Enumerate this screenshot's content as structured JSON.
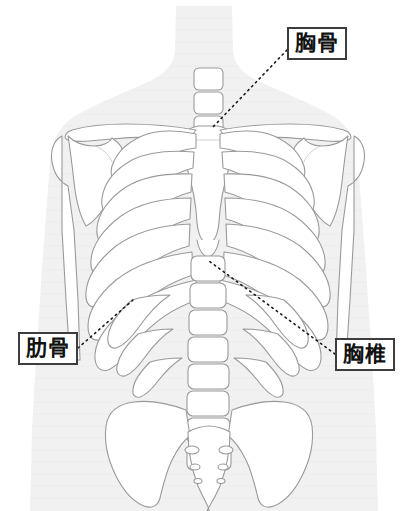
{
  "diagram": {
    "type": "anatomy-illustration",
    "region": "thorax",
    "view": "anterior",
    "colors": {
      "body_silhouette": "#f1f1f1",
      "bone_fill": "#ffffff",
      "bone_outline": "#9a9a9a",
      "label_border": "#3d3d3d",
      "label_text": "#111111",
      "leader_line": "#1a1a1a",
      "background": "#ffffff"
    }
  },
  "labels": [
    {
      "id": "sternum",
      "text": "胸骨",
      "reading": "kyokotsu",
      "english": "sternum",
      "box": {
        "x": 287,
        "y": 27,
        "width": 60,
        "height": 33
      },
      "leader": {
        "from_x": 287,
        "from_y": 50,
        "to_x": 212,
        "to_y": 128
      }
    },
    {
      "id": "ribs",
      "text": "肋骨",
      "reading": "rokkotsu",
      "english": "ribs",
      "box": {
        "x": 18,
        "y": 332,
        "width": 60,
        "height": 33
      },
      "leader": {
        "from_x": 78,
        "from_y": 348,
        "to_x": 133,
        "to_y": 300
      }
    },
    {
      "id": "thoracic-vertebrae",
      "text": "胸椎",
      "reading": "kyoutsui",
      "english": "thoracic vertebrae",
      "box": {
        "x": 335,
        "y": 338,
        "width": 60,
        "height": 33
      },
      "leader": {
        "from_x": 335,
        "from_y": 354,
        "to_x": 209,
        "to_y": 261
      }
    }
  ],
  "structures": [
    {
      "name": "neck",
      "label": "頸部"
    },
    {
      "name": "cervical-vertebrae",
      "label": "頸椎",
      "count": 3
    },
    {
      "name": "clavicle-left",
      "label": "左鎖骨"
    },
    {
      "name": "clavicle-right",
      "label": "右鎖骨"
    },
    {
      "name": "scapula-left",
      "label": "左肩甲骨"
    },
    {
      "name": "scapula-right",
      "label": "右肩甲骨"
    },
    {
      "name": "humerus-left",
      "label": "左上腕骨"
    },
    {
      "name": "humerus-right",
      "label": "右上腕骨"
    },
    {
      "name": "sternum-manubrium",
      "label": "胸骨柄"
    },
    {
      "name": "sternum-body",
      "label": "胸骨体"
    },
    {
      "name": "xiphoid-process",
      "label": "剣状突起"
    },
    {
      "name": "ribs",
      "label": "肋骨",
      "pairs": 10
    },
    {
      "name": "thoracic-vertebrae",
      "label": "胸椎",
      "count": 6
    },
    {
      "name": "lumbar-vertebrae",
      "label": "腰椎",
      "count": 5
    },
    {
      "name": "pelvis-ilium-left",
      "label": "左腸骨"
    },
    {
      "name": "pelvis-ilium-right",
      "label": "右腸骨"
    },
    {
      "name": "sacrum",
      "label": "仙骨"
    }
  ]
}
